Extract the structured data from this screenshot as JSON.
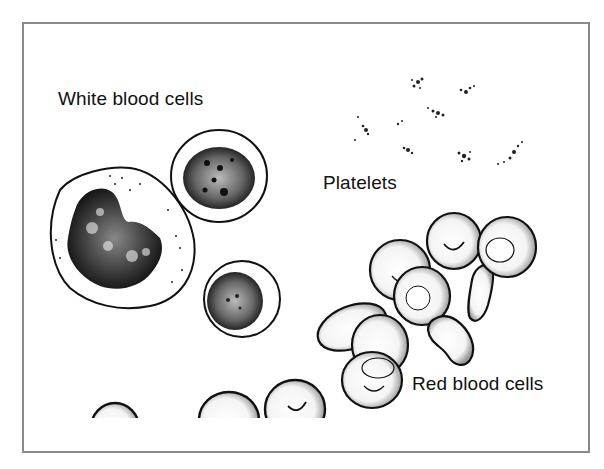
{
  "figure": {
    "labels": {
      "white_blood_cells": "White blood cells",
      "platelets": "Platelets",
      "red_blood_cells": "Red blood cells"
    },
    "colors": {
      "frame": "#8a8a8a",
      "ink": "#111111",
      "background": "#ffffff"
    },
    "cells": {
      "white_blood_cells_count": 3,
      "platelet_clusters_count": 8,
      "red_blood_cells_visible": 12
    }
  }
}
